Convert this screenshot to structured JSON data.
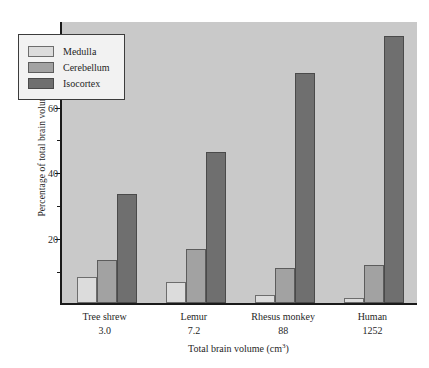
{
  "chart_data": {
    "type": "bar",
    "title": "",
    "xlabel": "Total brain volume (cm3)",
    "xlabel_text": "Total brain volume (cm",
    "xlabel_sup": "3",
    "xlabel_tail": ")",
    "ylabel": "Percentage of total brain volume",
    "categories": [
      "Tree shrew",
      "Lemur",
      "Rhesus monkey",
      "Human"
    ],
    "category_values": [
      "3.0",
      "7.2",
      "88",
      "1252"
    ],
    "series": [
      {
        "name": "Medulla",
        "color": "#dcdcdc",
        "values": [
          8,
          6.5,
          2.5,
          1.5
        ]
      },
      {
        "name": "Cerebellum",
        "color": "#a2a2a2",
        "values": [
          13,
          16.5,
          10.5,
          11.5
        ]
      },
      {
        "name": "Isocortex",
        "color": "#6f6f6f",
        "values": [
          33,
          46,
          70,
          81
        ]
      }
    ],
    "ylim": [
      0,
      86
    ],
    "yticks_major": [
      20,
      40,
      60,
      80
    ],
    "yticks_minor": [
      10,
      30,
      50,
      70
    ],
    "ytick_labels": [
      "20",
      "40",
      "60",
      "80"
    ],
    "grid": false,
    "legend_position": "upper-left",
    "plot_background": "#c9c9c9",
    "axis_color": "#1a1a1a"
  },
  "legend": {
    "items": [
      {
        "label": "Medulla",
        "swatch": "medulla"
      },
      {
        "label": "Cerebellum",
        "swatch": "cerebellum"
      },
      {
        "label": "Isocortex",
        "swatch": "isocortex"
      }
    ]
  }
}
